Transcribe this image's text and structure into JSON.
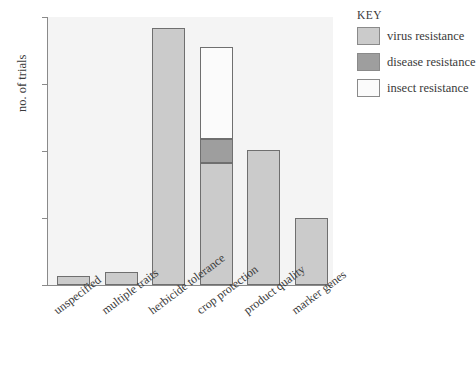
{
  "chart_data": {
    "type": "bar",
    "subtype": "stacked-bar",
    "title": "",
    "xlabel": "",
    "ylabel": "no. of trials",
    "ylim": [
      0,
      200
    ],
    "yticks": [
      0,
      50,
      100,
      150,
      200
    ],
    "grid": false,
    "categories": [
      "unspecified",
      "multiple traits",
      "herbicide tolerance",
      "crop protection",
      "product quality",
      "marker genes"
    ],
    "series": [
      {
        "name": "virus resistance",
        "color": "#cbcbcb",
        "values": [
          7,
          10,
          192,
          91,
          101,
          50
        ]
      },
      {
        "name": "disease resistance",
        "color": "#9e9e9e",
        "values": [
          0,
          0,
          0,
          18,
          0,
          0
        ]
      },
      {
        "name": "insect resistance",
        "color": "#fbfbfb",
        "values": [
          0,
          0,
          0,
          69,
          0,
          0
        ]
      }
    ],
    "totals": [
      7,
      10,
      192,
      178,
      101,
      50
    ],
    "legend": {
      "title": "KEY",
      "position": "right",
      "entries": [
        {
          "label": "virus resistance",
          "color": "#cbcbcb"
        },
        {
          "label": "disease resistance",
          "color": "#9e9e9e"
        },
        {
          "label": "insect resistance",
          "color": "#fbfbfb"
        }
      ]
    },
    "colors": {
      "plot_background": "#f4f4f4",
      "axis": "#8a8a8a",
      "bar_outline": "#6f6f6f",
      "text": "#3a3a3a"
    }
  }
}
